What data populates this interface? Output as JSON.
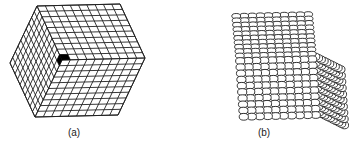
{
  "figure": {
    "panels": [
      {
        "id": "a",
        "label": "(a)",
        "description": "Cube of cubic unit cells (10x10x10 grid), one corner cell highlighted in black",
        "grid_n": 10,
        "highlight_color": "#000000"
      },
      {
        "id": "b",
        "label": "(b)",
        "description": "Cube built of packed spheres (atoms), 10x10x10"
      }
    ],
    "line_color": "#222222",
    "background": "#ffffff"
  }
}
